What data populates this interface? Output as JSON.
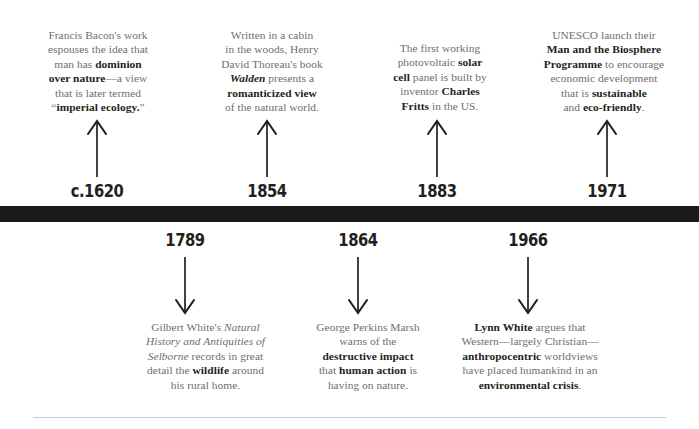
{
  "page": {
    "background_color": "#ffffff",
    "bar_color": "#1a1a1a",
    "body_text_color": "#6d6e71",
    "emphasis_text_color": "#231f20",
    "rule_color": "#c9cace"
  },
  "timeline": {
    "above_events": [
      {
        "year": "c.1620",
        "arrow": "up-arrow-icon",
        "text_plain": "Francis Bacon's work espouses the idea that man has dominion over nature—a view that is later termed “imperial ecology.”",
        "lines": [
          [
            {
              "t": "Francis Bacon's work",
              "s": "normal"
            }
          ],
          [
            {
              "t": "espouses the idea that",
              "s": "normal"
            }
          ],
          [
            {
              "t": "man has ",
              "s": "normal"
            },
            {
              "t": "dominion",
              "s": "bold"
            }
          ],
          [
            {
              "t": "over nature",
              "s": "bold"
            },
            {
              "t": "—a view",
              "s": "normal"
            }
          ],
          [
            {
              "t": "that is later termed",
              "s": "normal"
            }
          ],
          [
            {
              "t": "“",
              "s": "normal"
            },
            {
              "t": "imperial ecology.",
              "s": "bold"
            },
            {
              "t": "”",
              "s": "normal"
            }
          ]
        ]
      },
      {
        "year": "1854",
        "arrow": "up-arrow-icon",
        "text_plain": "Written in a cabin in the woods, Henry David Thoreau's book Walden presents a romanticized view of the natural world.",
        "lines": [
          [
            {
              "t": "Written in a cabin",
              "s": "normal"
            }
          ],
          [
            {
              "t": "in the woods, Henry",
              "s": "normal"
            }
          ],
          [
            {
              "t": "David Thoreau's book",
              "s": "normal"
            }
          ],
          [
            {
              "t": "Walden",
              "s": "bold-italic"
            },
            {
              "t": " presents a",
              "s": "normal"
            }
          ],
          [
            {
              "t": "romanticized view",
              "s": "bold"
            }
          ],
          [
            {
              "t": "of the natural world.",
              "s": "normal"
            }
          ]
        ]
      },
      {
        "year": "1883",
        "arrow": "up-arrow-icon",
        "text_plain": "The first working photovoltaic solar cell panel is built by inventor Charles Fritts in the US.",
        "lines": [
          [
            {
              "t": "The first working",
              "s": "normal"
            }
          ],
          [
            {
              "t": "photovoltaic ",
              "s": "normal"
            },
            {
              "t": "solar",
              "s": "bold"
            }
          ],
          [
            {
              "t": "cell",
              "s": "bold"
            },
            {
              "t": " panel is built by",
              "s": "normal"
            }
          ],
          [
            {
              "t": "inventor ",
              "s": "normal"
            },
            {
              "t": "Charles",
              "s": "bold"
            }
          ],
          [
            {
              "t": "Fritts",
              "s": "bold"
            },
            {
              "t": " in the US.",
              "s": "normal"
            }
          ]
        ]
      },
      {
        "year": "1971",
        "arrow": "up-arrow-icon",
        "text_plain": "UNESCO launch their Man and the Biosphere Programme to encourage economic development that is sustainable and eco-friendly.",
        "lines": [
          [
            {
              "t": "UNESCO launch their",
              "s": "normal"
            }
          ],
          [
            {
              "t": "Man and the Biosphere",
              "s": "bold"
            }
          ],
          [
            {
              "t": "Programme",
              "s": "bold"
            },
            {
              "t": " to encourage",
              "s": "normal"
            }
          ],
          [
            {
              "t": "economic development",
              "s": "normal"
            }
          ],
          [
            {
              "t": "that is ",
              "s": "normal"
            },
            {
              "t": "sustainable",
              "s": "bold"
            }
          ],
          [
            {
              "t": "and ",
              "s": "normal"
            },
            {
              "t": "eco-friendly",
              "s": "bold"
            },
            {
              "t": ".",
              "s": "normal"
            }
          ]
        ]
      }
    ],
    "below_events": [
      {
        "year": "1789",
        "arrow": "down-arrow-icon",
        "text_plain": "Gilbert White's Natural History and Antiquities of Selborne records in great detail the wildlife around his rural home.",
        "lines": [
          [
            {
              "t": "Gilbert White's ",
              "s": "normal"
            },
            {
              "t": "Natural",
              "s": "italic"
            }
          ],
          [
            {
              "t": "History and Antiquities of",
              "s": "italic"
            }
          ],
          [
            {
              "t": "Selborne",
              "s": "italic"
            },
            {
              "t": " records in great",
              "s": "normal"
            }
          ],
          [
            {
              "t": "detail the ",
              "s": "normal"
            },
            {
              "t": "wildlife",
              "s": "bold"
            },
            {
              "t": " around",
              "s": "normal"
            }
          ],
          [
            {
              "t": "his rural home.",
              "s": "normal"
            }
          ]
        ]
      },
      {
        "year": "1864",
        "arrow": "down-arrow-icon",
        "text_plain": "George Perkins Marsh warns of the destructive impact that human action is having on nature.",
        "lines": [
          [
            {
              "t": "George Perkins Marsh",
              "s": "normal"
            }
          ],
          [
            {
              "t": "warns of the",
              "s": "normal"
            }
          ],
          [
            {
              "t": "destructive impact",
              "s": "bold"
            }
          ],
          [
            {
              "t": "that ",
              "s": "normal"
            },
            {
              "t": "human action",
              "s": "bold"
            },
            {
              "t": " is",
              "s": "normal"
            }
          ],
          [
            {
              "t": "having on nature.",
              "s": "normal"
            }
          ]
        ]
      },
      {
        "year": "1966",
        "arrow": "down-arrow-icon",
        "text_plain": "Lynn White argues that Western—largely Christian—anthropocentric worldviews have placed humankind in an environmental crisis.",
        "lines": [
          [
            {
              "t": "Lynn White",
              "s": "bold"
            },
            {
              "t": " argues that",
              "s": "normal"
            }
          ],
          [
            {
              "t": "Western—largely Christian—",
              "s": "normal"
            }
          ],
          [
            {
              "t": "anthropocentric",
              "s": "bold"
            },
            {
              "t": " worldviews",
              "s": "normal"
            }
          ],
          [
            {
              "t": "have placed humankind in an",
              "s": "normal"
            }
          ],
          [
            {
              "t": "environmental crisis",
              "s": "bold"
            },
            {
              "t": ".",
              "s": "normal"
            }
          ]
        ]
      }
    ]
  }
}
